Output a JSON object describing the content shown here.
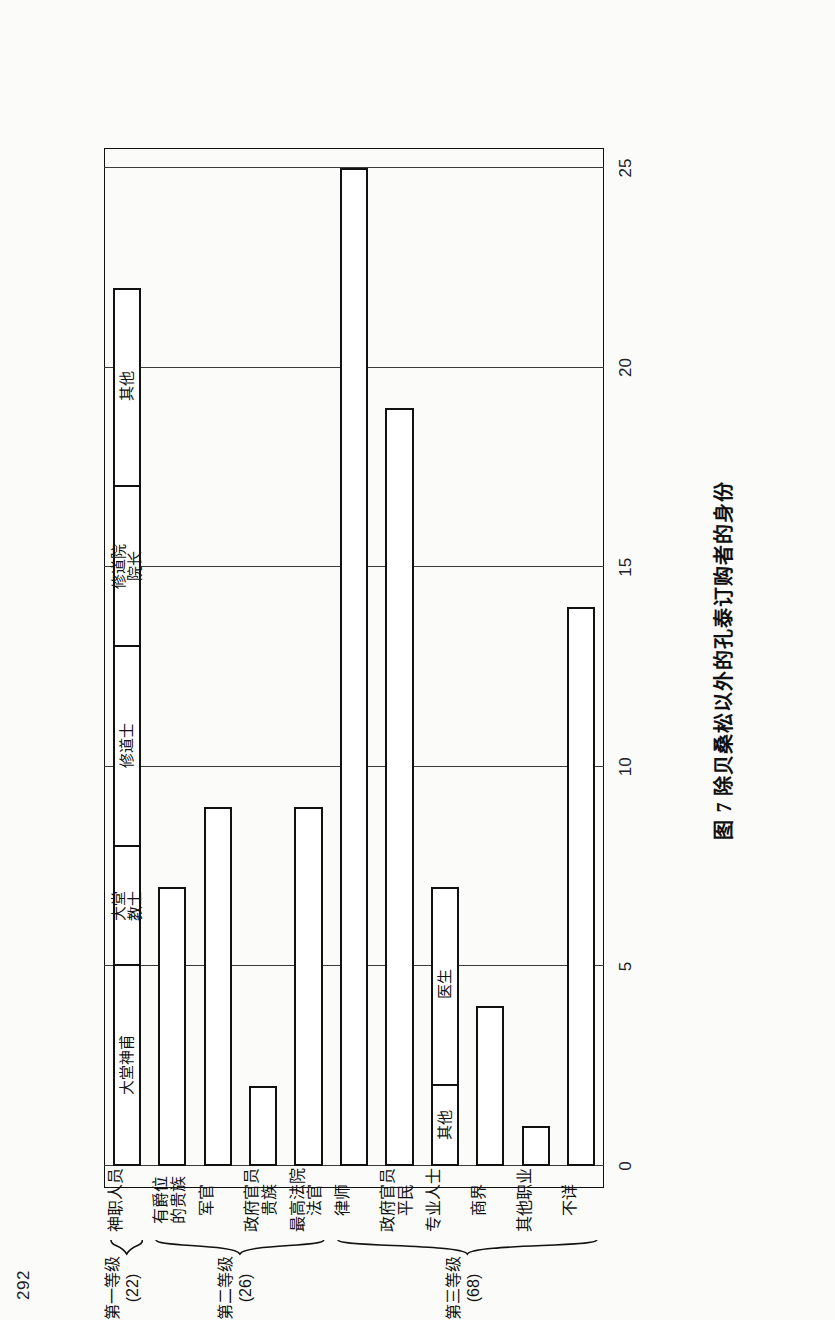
{
  "page": {
    "number": "292"
  },
  "caption": {
    "text": "图 7  除贝桑松以外的孔泰订购者的身份"
  },
  "axis": {
    "ticks": [
      "25",
      "20",
      "15",
      "10",
      "5",
      "0"
    ],
    "tick_values": [
      25,
      20,
      15,
      10,
      5,
      0
    ]
  },
  "groups": [
    {
      "tier_label": "第一等级\n(22)",
      "count": 22
    },
    {
      "tier_label": "第二等级\n(26)",
      "count": 26
    },
    {
      "tier_label": "第三等级\n(68)",
      "count": 68
    }
  ],
  "chart_data": {
    "type": "bar",
    "orientation": "horizontal",
    "title": "图 7  除贝桑松以外的孔泰订购者的身份",
    "xlabel": "",
    "ylabel": "",
    "xlim": [
      0,
      25
    ],
    "grid": true,
    "legend": "none",
    "categories": [
      "神职人员",
      "有爵位的贵族",
      "军官",
      "政府官员 贵族",
      "最高法院法官",
      "律师",
      "政府官员 平民",
      "专业人士",
      "商界",
      "其他职业",
      "不详"
    ],
    "values": [
      22,
      7,
      9,
      2,
      9,
      25,
      19,
      7,
      4,
      1,
      14
    ],
    "stacked_segments": {
      "神职人员": [
        {
          "label": "大堂神甫",
          "value": 5
        },
        {
          "label": "大堂\n教士",
          "value": 3
        },
        {
          "label": "修道士",
          "value": 5
        },
        {
          "label": "修道院\n院长",
          "value": 4
        },
        {
          "label": "其他",
          "value": 5
        }
      ],
      "专业人士": [
        {
          "label": "其他",
          "value": 2
        },
        {
          "label": "医生",
          "value": 5
        }
      ]
    }
  },
  "bars": [
    {
      "name": "神职人员",
      "label": "神职人员",
      "value": 22,
      "group": 0,
      "segments": [
        {
          "label": "大堂神甫",
          "value": 5
        },
        {
          "label": "大堂\n教士",
          "value": 3
        },
        {
          "label": "修道士",
          "value": 5
        },
        {
          "label": "修道院\n院长",
          "value": 4
        },
        {
          "label": "其他",
          "value": 5
        }
      ]
    },
    {
      "name": "有爵位的贵族",
      "label": "有爵位\n的贵族",
      "value": 7,
      "group": 1,
      "segments": []
    },
    {
      "name": "军官",
      "label": "军官",
      "value": 9,
      "group": 1,
      "segments": []
    },
    {
      "name": "政府官员贵族",
      "label": "政府官员\n贵族",
      "value": 2,
      "group": 1,
      "segments": []
    },
    {
      "name": "最高法院法官",
      "label": "最高法院\n法官",
      "value": 9,
      "group": 1,
      "segments": []
    },
    {
      "name": "律师",
      "label": "律师",
      "value": 25,
      "group": 2,
      "segments": []
    },
    {
      "name": "政府官员平民",
      "label": "政府官员\n平民",
      "value": 19,
      "group": 2,
      "segments": []
    },
    {
      "name": "专业人士",
      "label": "专业人士",
      "value": 7,
      "group": 2,
      "segments": [
        {
          "label": "其他",
          "value": 2
        },
        {
          "label": "医生",
          "value": 5
        }
      ]
    },
    {
      "name": "商界",
      "label": "商界",
      "value": 4,
      "group": 2,
      "segments": []
    },
    {
      "name": "其他职业",
      "label": "其他职业",
      "value": 1,
      "group": 2,
      "segments": []
    },
    {
      "name": "不详",
      "label": "不详",
      "value": 14,
      "group": 2,
      "segments": []
    }
  ]
}
